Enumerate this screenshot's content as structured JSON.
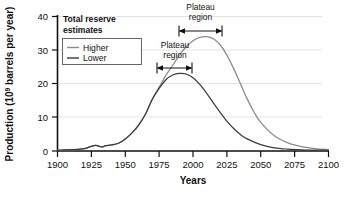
{
  "chart_data": {
    "type": "line",
    "title": "",
    "xlabel": "Years",
    "ylabel": "Production (10⁹ barrels per year)",
    "ylabel_main": "Production (10",
    "ylabel_sup": "9",
    "ylabel_rest": " barrels per year)",
    "xlim": [
      1900,
      2100
    ],
    "ylim": [
      0,
      40
    ],
    "xticks": [
      "1900",
      "1925",
      "1950",
      "1975",
      "2000",
      "2025",
      "2050",
      "2075",
      "2100"
    ],
    "xtick_values": [
      1900,
      1925,
      1950,
      1975,
      2000,
      2025,
      2050,
      2075,
      2100
    ],
    "yticks": [
      "0",
      "10",
      "20",
      "30",
      "40"
    ],
    "ytick_values": [
      0,
      10,
      20,
      30,
      40
    ],
    "grid": "horizontal",
    "legend_position": "top-left",
    "legend_title": "Total reserve estimates",
    "series": [
      {
        "name": "Higher",
        "color": "#8a8a8a",
        "x": [
          1900,
          1905,
          1910,
          1915,
          1920,
          1925,
          1928,
          1930,
          1933,
          1935,
          1938,
          1940,
          1945,
          1950,
          1955,
          1960,
          1965,
          1970,
          1975,
          1980,
          1985,
          1990,
          1995,
          2000,
          2005,
          2010,
          2015,
          2020,
          2025,
          2030,
          2035,
          2040,
          2045,
          2050,
          2060,
          2070,
          2080,
          2090,
          2100
        ],
        "values": [
          0.2,
          0.3,
          0.4,
          0.5,
          0.7,
          1.4,
          1.7,
          1.5,
          1.2,
          1.5,
          1.7,
          1.8,
          2.3,
          3.6,
          5.4,
          7.8,
          11.0,
          15.5,
          19.0,
          22.5,
          25.5,
          28.5,
          31.0,
          32.8,
          33.8,
          34.0,
          33.4,
          31.6,
          28.5,
          24.5,
          20.0,
          15.5,
          11.6,
          8.5,
          4.5,
          2.4,
          1.3,
          0.7,
          0.4
        ]
      },
      {
        "name": "Lower",
        "color": "#3c3c3c",
        "x": [
          1900,
          1905,
          1910,
          1915,
          1920,
          1925,
          1928,
          1930,
          1933,
          1935,
          1938,
          1940,
          1945,
          1950,
          1955,
          1960,
          1965,
          1970,
          1975,
          1980,
          1985,
          1990,
          1995,
          2000,
          2005,
          2010,
          2015,
          2020,
          2025,
          2030,
          2035,
          2040,
          2050,
          2060,
          2070,
          2080,
          2090,
          2100
        ],
        "values": [
          0.2,
          0.3,
          0.4,
          0.5,
          0.7,
          1.4,
          1.7,
          1.5,
          1.2,
          1.5,
          1.7,
          1.8,
          2.3,
          3.6,
          5.4,
          7.8,
          11.0,
          15.4,
          18.6,
          21.2,
          22.6,
          23.1,
          22.9,
          21.8,
          19.8,
          17.2,
          14.3,
          11.5,
          8.9,
          6.7,
          4.9,
          3.6,
          1.9,
          0.95,
          0.55,
          0.35,
          0.25,
          0.2
        ]
      }
    ],
    "annotations": [
      {
        "label_line1": "Plateau",
        "label_line2": "region",
        "series": "Higher",
        "x_start": 1990,
        "x_end": 2022
      },
      {
        "label_line1": "Plateau",
        "label_line2": "region",
        "series": "Lower",
        "x_start": 1974,
        "x_end": 2000
      }
    ]
  }
}
